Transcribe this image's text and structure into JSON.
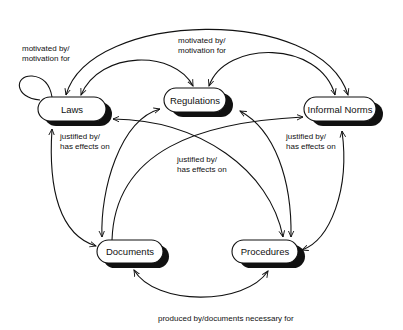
{
  "diagram": {
    "nodes": [
      {
        "id": "laws",
        "label": "Laws"
      },
      {
        "id": "regulations",
        "label": "Regulations"
      },
      {
        "id": "informal_norms",
        "label": "Informal Norms"
      },
      {
        "id": "documents",
        "label": "Documents"
      },
      {
        "id": "procedures",
        "label": "Procedures"
      }
    ],
    "edge_labels": {
      "laws_self": [
        "motivated by/",
        "motivation for"
      ],
      "top": [
        "motivated by/",
        "motivation for"
      ],
      "laws_down": [
        "justified by/",
        "has effects on"
      ],
      "center": [
        "justified by/",
        "has effects on"
      ],
      "norms_down": [
        "justified by/",
        "has effects on"
      ],
      "bottom": "produced by/documents necessary for"
    },
    "edges": [
      {
        "from": "laws",
        "to": "laws",
        "label": "motivated by/motivation for"
      },
      {
        "from": "laws",
        "to": "regulations",
        "label": "motivated by/motivation for",
        "bidirectional": true
      },
      {
        "from": "laws",
        "to": "informal_norms",
        "label": "motivated by/motivation for",
        "bidirectional": true
      },
      {
        "from": "regulations",
        "to": "informal_norms",
        "label": "motivated by/motivation for",
        "bidirectional": true
      },
      {
        "from": "laws",
        "to": "documents",
        "label": "justified by/has effects on",
        "bidirectional": true
      },
      {
        "from": "laws",
        "to": "procedures",
        "label": "justified by/has effects on",
        "bidirectional": true
      },
      {
        "from": "regulations",
        "to": "documents",
        "label": "justified by/has effects on",
        "bidirectional": true
      },
      {
        "from": "regulations",
        "to": "procedures",
        "label": "justified by/has effects on",
        "bidirectional": true
      },
      {
        "from": "informal_norms",
        "to": "documents",
        "label": "justified by/has effects on",
        "bidirectional": true
      },
      {
        "from": "informal_norms",
        "to": "procedures",
        "label": "justified by/has effects on",
        "bidirectional": true
      },
      {
        "from": "documents",
        "to": "procedures",
        "label": "produced by/documents necessary for",
        "bidirectional": true
      }
    ]
  }
}
